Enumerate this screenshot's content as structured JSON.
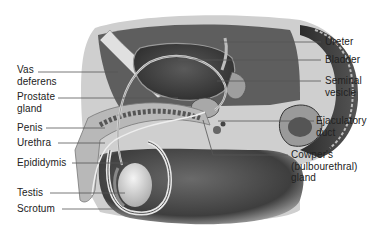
{
  "diagram": {
    "colors": {
      "background": "#ffffff",
      "label_text": "#222222",
      "leader_line": "#555555",
      "tissue_dark": "#3a3a3a",
      "tissue_mid": "#8a8a8a",
      "tissue_light": "#d6d6d6"
    },
    "labels_left": [
      {
        "id": "vas-deferens",
        "text": "Vas\ndeferens"
      },
      {
        "id": "prostate-gland",
        "text": "Prostate\ngland"
      },
      {
        "id": "penis",
        "text": "Penis"
      },
      {
        "id": "urethra",
        "text": "Urethra"
      },
      {
        "id": "epididymis",
        "text": "Epididymis"
      },
      {
        "id": "testis",
        "text": "Testis"
      },
      {
        "id": "scrotum",
        "text": "Scrotum"
      }
    ],
    "labels_right": [
      {
        "id": "ureter",
        "text": "Ureter"
      },
      {
        "id": "bladder",
        "text": "Bladder"
      },
      {
        "id": "seminal-vesicle",
        "text": "Seminal\nvesicle"
      },
      {
        "id": "ejaculatory-duct",
        "text": "Ejaculatory\nduct"
      },
      {
        "id": "cowpers-gland",
        "text": "Cowper's\n(bulbourethral)\ngland"
      }
    ]
  }
}
